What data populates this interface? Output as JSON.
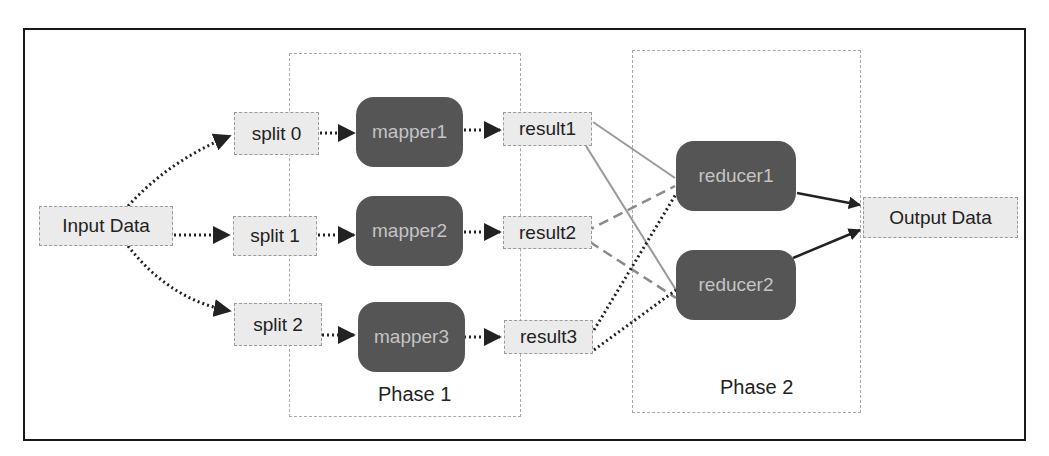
{
  "diagram": {
    "input": "Input Data",
    "output": "Output Data",
    "splits": [
      "split 0",
      "split 1",
      "split 2"
    ],
    "mappers": [
      "mapper1",
      "mapper2",
      "mapper3"
    ],
    "results": [
      "result1",
      "result2",
      "result3"
    ],
    "reducers": [
      "reducer1",
      "reducer2"
    ],
    "phases": [
      "Phase 1",
      "Phase 2"
    ]
  },
  "colors": {
    "node_fill": "#555555",
    "node_text": "#c4c4c4",
    "box_fill": "#ebebeb",
    "solid_edge": "#9a9a9a",
    "dashed_edge": "#8a8a8a",
    "dotted_edge": "#222222"
  }
}
